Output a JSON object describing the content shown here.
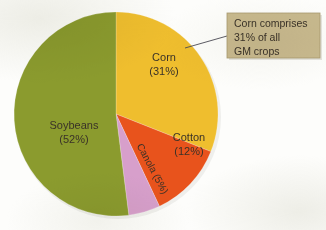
{
  "figure": {
    "background_color": "#fdfdfb",
    "callout": {
      "name": "corn-callout",
      "lines": [
        "Corn comprises",
        "31% of all",
        "GM crops"
      ],
      "box_color": "#c8b98e",
      "box_border_color": "#a99a6f",
      "text_color": "#3a3228",
      "leader_line_color": "#4b4a55",
      "box": {
        "x": 227,
        "y": 13,
        "width": 93,
        "height": 45
      },
      "leader": {
        "x1": 185,
        "y1": 48,
        "x2": 227,
        "y2": 36
      }
    },
    "pie": {
      "center_x": 116,
      "center_y": 114,
      "radius": 102,
      "start_angle_deg": 0,
      "direction": "clockwise"
    }
  },
  "chart_data": {
    "type": "pie",
    "title": "",
    "unit": "percent",
    "total": 100,
    "legend_position": "none",
    "labels_inside_slices": true,
    "categories": [
      "Corn",
      "Cotton",
      "Canola",
      "Soybeans"
    ],
    "values": [
      31,
      12,
      5,
      52
    ],
    "colors": [
      "#efbe2e",
      "#e8531c",
      "#d79fcb",
      "#8b9b2e"
    ],
    "slices": [
      {
        "name": "corn",
        "label": "Corn",
        "value": 31,
        "value_label": "(31%)",
        "color": "#efbe2e",
        "label_x": 164,
        "label_y": 58,
        "rotation_deg": 0,
        "font_size": 11
      },
      {
        "name": "cotton",
        "label": "Cotton",
        "value": 12,
        "value_label": "(12%)",
        "color": "#e8531c",
        "label_x": 189,
        "label_y": 138,
        "rotation_deg": 0,
        "font_size": 11
      },
      {
        "name": "canola",
        "label": "Canola (5%)",
        "value": 5,
        "value_label": "(5%)",
        "color": "#d79fcb",
        "label_x": 152,
        "label_y": 169,
        "rotation_deg": 62,
        "font_size": 10
      },
      {
        "name": "soybeans",
        "label": "Soybeans",
        "value": 52,
        "value_label": "(52%)",
        "color": "#8b9b2e",
        "label_x": 74,
        "label_y": 126,
        "rotation_deg": 0,
        "font_size": 11
      }
    ],
    "annotations": [
      {
        "name": "corn-annotation",
        "text": "Corn comprises 31% of all GM crops",
        "target_category": "Corn"
      }
    ]
  }
}
